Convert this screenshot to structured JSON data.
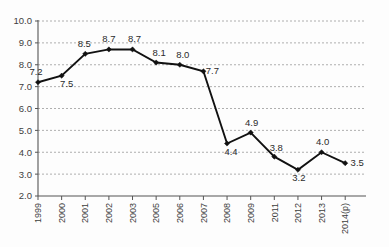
{
  "chart_data": {
    "type": "line",
    "title": "",
    "subtitle": "",
    "xlabel": "",
    "ylabel": "",
    "categories": [
      "1999",
      "2000",
      "2001",
      "2002",
      "2003",
      "2005",
      "2006",
      "2007",
      "2008",
      "2009",
      "2011",
      "2012",
      "2013",
      "2014(p)"
    ],
    "values": [
      7.2,
      7.5,
      8.5,
      8.7,
      8.7,
      8.1,
      8.0,
      7.7,
      4.4,
      4.9,
      3.8,
      3.2,
      4.0,
      3.5
    ],
    "point_labels": [
      "7.2",
      "7.5",
      "8.5",
      "8.7",
      "8.7",
      "8.1",
      "8.0",
      "7.7",
      "4.4",
      "4.9",
      "3.8",
      "3.2",
      "4.0",
      "3.5"
    ],
    "ylim": [
      2.0,
      10.0
    ],
    "ytick_values": [
      2.0,
      3.0,
      4.0,
      5.0,
      6.0,
      7.0,
      8.0,
      9.0,
      10.0
    ],
    "ytick_labels": [
      "2.0",
      "3.0",
      "4.0",
      "5.0",
      "6.0",
      "7.0",
      "8.0",
      "9.0",
      "10.0"
    ],
    "grid": true,
    "grid_style": "dashed-horizontal",
    "legend": false,
    "legend_position": "none",
    "marker": "diamond",
    "series_color": "#111111",
    "grid_color": "#9a9a9a",
    "axis_color": "#555555",
    "background_color": "#fdfdfd",
    "xtick_label_rotation": -90,
    "label_offsets": [
      {
        "dx": -2,
        "dy": -7
      },
      {
        "dx": 5,
        "dy": 11
      },
      {
        "dx": -1,
        "dy": -7
      },
      {
        "dx": 0,
        "dy": -7
      },
      {
        "dx": 2,
        "dy": -7
      },
      {
        "dx": 3,
        "dy": -7
      },
      {
        "dx": 3,
        "dy": -7
      },
      {
        "dx": 9,
        "dy": 3
      },
      {
        "dx": 4,
        "dy": 11
      },
      {
        "dx": 1,
        "dy": -7
      },
      {
        "dx": 2,
        "dy": -6
      },
      {
        "dx": 1,
        "dy": 11
      },
      {
        "dx": 1,
        "dy": -7
      },
      {
        "dx": 12,
        "dy": 3
      }
    ]
  }
}
